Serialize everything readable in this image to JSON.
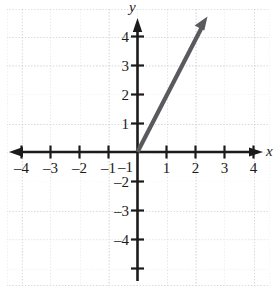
{
  "figure": {
    "kind": "cartesian-coordinate-plane",
    "background_color": "#ffffff",
    "grid_color": "#c9c9cf",
    "axis_color": "#1b1b1b",
    "curve_color": "#5a5a5e",
    "axis_labels": {
      "x": "x",
      "y": "y"
    }
  },
  "chart_data": {
    "type": "line",
    "title": "",
    "xlabel": "x",
    "ylabel": "y",
    "xlim": [
      -4.5,
      4.5
    ],
    "ylim": [
      -4.6,
      4.7
    ],
    "grid": true,
    "grid_step": 1,
    "legend": "none",
    "x_ticks": [
      -4,
      -3,
      -2,
      -1,
      1,
      2,
      3,
      4
    ],
    "x_tick_labels": [
      "–4",
      "–3",
      "–2",
      "–1",
      "1",
      "2",
      "3",
      "4"
    ],
    "y_ticks": [
      4,
      3,
      2,
      1,
      -1,
      -2,
      -3,
      -4
    ],
    "y_tick_labels": [
      "4",
      "3",
      "2",
      "1",
      "–1",
      "–2",
      "–3",
      "–4"
    ],
    "series": [
      {
        "name": "ray",
        "kind": "ray",
        "slope": 2,
        "intercept": 0,
        "start_point": [
          0,
          0
        ],
        "end_point": [
          2.4,
          4.7
        ],
        "arrow_at_end": true,
        "color": "#5a5a5e",
        "x": [
          0,
          2.4
        ],
        "values": [
          0,
          4.8
        ]
      }
    ],
    "annotations": []
  },
  "axes": {
    "x_axis": {
      "name": "x-axis",
      "arrow_left": true,
      "arrow_right": true
    },
    "y_axis": {
      "name": "y-axis",
      "arrow_up": true,
      "arrow_down": false
    }
  }
}
